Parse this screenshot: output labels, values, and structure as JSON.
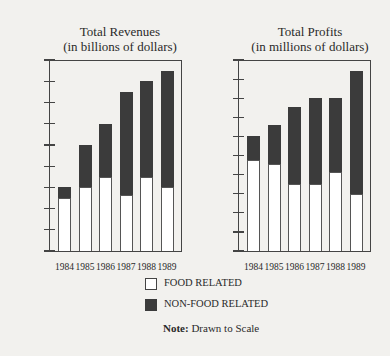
{
  "chart_data": [
    {
      "type": "bar",
      "stacked": true,
      "title": "Total Revenues",
      "subtitle": "(in billions of dollars)",
      "xlabel": "",
      "ylabel": "",
      "categories": [
        "1984",
        "1985",
        "1986",
        "1987",
        "1988",
        "1989"
      ],
      "series": [
        {
          "name": "FOOD RELATED",
          "values": [
            2.5,
            3.0,
            3.5,
            2.65,
            3.5,
            3.0
          ]
        },
        {
          "name": "NON-FOOD RELATED",
          "values": [
            0.5,
            2.0,
            2.5,
            4.85,
            4.5,
            5.5
          ]
        }
      ],
      "totals": [
        3.0,
        5.0,
        6.0,
        7.5,
        8.0,
        8.5
      ],
      "ylim": [
        0,
        9
      ],
      "yticks": [
        "$0",
        "$1",
        "$2",
        "$3",
        "$4",
        "$5",
        "$6",
        "$7",
        "$8",
        "$9"
      ],
      "grid": false
    },
    {
      "type": "bar",
      "stacked": true,
      "title": "Total Profits",
      "subtitle": "(in millions of dollars)",
      "xlabel": "",
      "ylabel": "",
      "categories": [
        "1984",
        "1985",
        "1986",
        "1987",
        "1988",
        "1989"
      ],
      "series": [
        {
          "name": "FOOD RELATED",
          "values": [
            475,
            455,
            350,
            350,
            415,
            300
          ]
        },
        {
          "name": "NON-FOOD RELATED",
          "values": [
            125,
            205,
            405,
            450,
            385,
            645
          ]
        }
      ],
      "totals": [
        600,
        660,
        755,
        800,
        800,
        945
      ],
      "ylim": [
        0,
        1000
      ],
      "yticks": [
        "$0",
        "$100",
        "$200",
        "$300",
        "$400",
        "$500",
        "$600",
        "$700",
        "$800",
        "$900",
        "$1,000"
      ],
      "grid": false
    }
  ],
  "legend": {
    "position": "bottom-center",
    "items": [
      {
        "label": "FOOD RELATED",
        "color": "#ffffff"
      },
      {
        "label": "NON-FOOD RELATED",
        "color": "#3b3b3b"
      }
    ]
  },
  "note": {
    "label": "Note:",
    "text": " Drawn to Scale"
  }
}
